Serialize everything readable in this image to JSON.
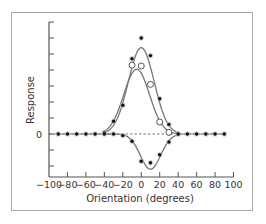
{
  "chart_data": {
    "type": "scatter",
    "title": "",
    "xlabel": "Orientation (degrees)",
    "ylabel": "Response",
    "xlim": [
      -100,
      100
    ],
    "ylim": [
      -3,
      7
    ],
    "x_ticks": [
      -100,
      -80,
      -60,
      -40,
      -20,
      0,
      20,
      40,
      60,
      80,
      100
    ],
    "y_tick_labels": [
      {
        "value": 0,
        "label": "0"
      }
    ],
    "y_tick_count_unlabeled": 9,
    "zero_line": {
      "style": "dashed",
      "y": 0
    },
    "grid": false,
    "legend": null,
    "series": [
      {
        "name": "filled-positive",
        "marker": "filled-circle",
        "x": [
          -90,
          -80,
          -70,
          -60,
          -50,
          -40,
          -30,
          -20,
          -10,
          0,
          10,
          20,
          30,
          40,
          50,
          60,
          70,
          80,
          90
        ],
        "values": [
          0,
          0,
          0,
          0,
          0,
          0.1,
          0.8,
          1.8,
          4.7,
          6.0,
          4.9,
          2.2,
          0.6,
          0,
          0,
          0,
          0,
          0,
          0
        ]
      },
      {
        "name": "open-circles",
        "marker": "open-circle",
        "x": [
          -10,
          0,
          10,
          20,
          30
        ],
        "values": [
          4.3,
          4.25,
          3.1,
          0.75,
          0.1
        ]
      },
      {
        "name": "filled-negative",
        "marker": "filled-circle",
        "x": [
          -40,
          -30,
          -20,
          -10,
          0,
          10,
          20,
          30,
          40
        ],
        "values": [
          0,
          0,
          -0.1,
          -0.45,
          -1.7,
          -1.8,
          -1.3,
          -0.5,
          0
        ]
      }
    ],
    "fit_curves": [
      {
        "name": "upper-fit",
        "peak_x": 0,
        "peak_y": 5.4,
        "sigma": 14
      },
      {
        "name": "lower-fit",
        "peak_x": -5,
        "peak_y": 4.05,
        "sigma": 14
      },
      {
        "name": "negative-fit",
        "peak_x": 10,
        "peak_y": -2.2,
        "sigma": 11
      }
    ],
    "colors": {
      "axis": "#555555",
      "curve": "#777777",
      "marker": "#111111",
      "frame": "#a8a8a8"
    }
  }
}
